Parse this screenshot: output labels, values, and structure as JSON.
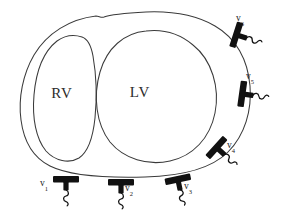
{
  "figure": {
    "background_color": "#ffffff",
    "contour_color": "#3a3a3a",
    "probe_color": "#111111",
    "label_color": "#1a1a1a",
    "width": 286,
    "height": 223
  },
  "chambers": [
    {
      "id": "rv",
      "label": "RV",
      "name": "right-ventricle",
      "label_x": 62,
      "label_y": 98
    },
    {
      "id": "lv",
      "label": "LV",
      "name": "left-ventricle",
      "label_x": 140,
      "label_y": 97
    }
  ],
  "transducers": [
    {
      "id": "v1",
      "label": "v",
      "subscript": "1",
      "label_x": 44,
      "label_y": 186,
      "probe_x": 66,
      "probe_y": 180,
      "rotation": 0
    },
    {
      "id": "v2",
      "label": "v",
      "subscript": "2",
      "label_x": 129,
      "label_y": 191,
      "probe_x": 121,
      "probe_y": 183,
      "rotation": 0
    },
    {
      "id": "v3",
      "label": "v",
      "subscript": "3",
      "label_x": 188,
      "label_y": 189,
      "probe_x": 178,
      "probe_y": 180,
      "rotation": -12
    },
    {
      "id": "v4",
      "label": "v",
      "subscript": "4",
      "label_x": 231,
      "label_y": 148,
      "probe_x": 217,
      "probe_y": 148,
      "rotation": -48
    },
    {
      "id": "v5",
      "label": "v",
      "subscript": "5",
      "label_x": 250,
      "label_y": 79,
      "probe_x": 243,
      "probe_y": 94,
      "rotation": -82
    },
    {
      "id": "v6",
      "label": "v",
      "subscript": "6",
      "label_x": 240,
      "label_y": 21,
      "probe_x": 237,
      "probe_y": 35,
      "rotation": -72
    }
  ],
  "chart_data": {
    "type": "diagram",
    "annotations": [
      "RV",
      "LV",
      "v1",
      "v2",
      "v3",
      "v4",
      "v5",
      "v6"
    ],
    "transducer_count": 6,
    "chamber_count": 2
  }
}
